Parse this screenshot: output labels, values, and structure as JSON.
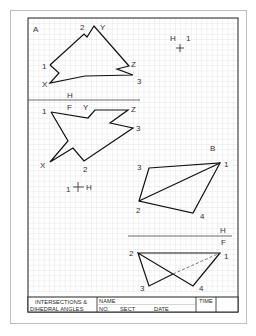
{
  "worksheet": {
    "title_block": {
      "title_line1": "INTERSECTIONS &",
      "title_line2": "DIHEDRAL ANGLES",
      "name_label": "NAME",
      "no_label": "NO.",
      "sect_label": "SECT",
      "date_label": "DATE",
      "time_label": "TIME"
    },
    "colors": {
      "line": "#111111",
      "grid": "#c9c9c9",
      "paper": "#ffffff",
      "label": "#333333"
    },
    "figure_a": {
      "view_label": "A",
      "vertex_labels": {
        "p2": "2",
        "y": "Y",
        "p1": "1",
        "x": "X",
        "z": "Z",
        "p3": "3"
      },
      "fold_line_label_h": "H",
      "fold_line_label_f": "F"
    },
    "reference_point_top": {
      "label_h": "H",
      "label_1": "1"
    },
    "figure_h": {
      "vertex_labels": {
        "p1": "1",
        "f": "F",
        "y": "Y",
        "z": "Z",
        "p3": "3",
        "x": "X",
        "p2": "2"
      }
    },
    "reference_point_mid": {
      "label_1": "1",
      "label_h": "H"
    },
    "figure_b": {
      "view_label": "B",
      "vertex_labels": {
        "p3": "3",
        "p1": "1",
        "p2": "2",
        "p4": "4"
      }
    },
    "figure_f": {
      "fold_label_h": "H",
      "fold_label_f": "F",
      "vertex_labels": {
        "p2": "2",
        "p1": "1",
        "p3": "3",
        "p4": "4"
      }
    }
  }
}
